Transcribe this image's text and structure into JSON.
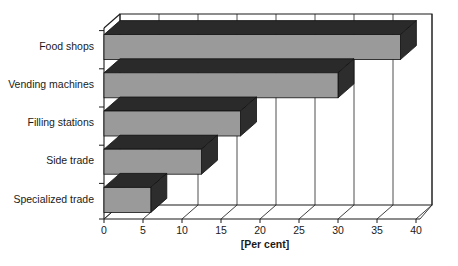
{
  "chart_data": {
    "type": "bar",
    "orientation": "horizontal",
    "style": "3d",
    "title": "",
    "subtitle": "",
    "xlabel": "[Per cent]",
    "ylabel": "",
    "categories": [
      "Specialized trade",
      "Side trade",
      "Filling stations",
      "Vending machines",
      "Food shops"
    ],
    "values": [
      6,
      12.5,
      17.5,
      30,
      38
    ],
    "xlim": [
      0,
      40
    ],
    "xticks": [
      0,
      5,
      10,
      15,
      20,
      25,
      30,
      35,
      40
    ],
    "xtick_labels": [
      "0",
      "5",
      "10",
      "15",
      "20",
      "25",
      "30",
      "35",
      "40"
    ],
    "grid": true,
    "grid_axis": "x",
    "legend": null,
    "legend_position": "none",
    "annotations": []
  },
  "colors": {
    "bar_front": "#9a9a9a",
    "bar_top": "#2a2a2a",
    "bar_side": "#2d2d2d",
    "axis": "#1a1a1a",
    "grid": "#3a3a3a",
    "background": "#ffffff",
    "text": "#1a1a1a"
  },
  "axis": {
    "x_title": "[Per cent]",
    "tick_labels": [
      "0",
      "5",
      "10",
      "15",
      "20",
      "25",
      "30",
      "35",
      "40"
    ]
  },
  "categories_top_to_bottom": [
    "Food shops",
    "Vending machines",
    "Filling stations",
    "Side trade",
    "Specialized trade"
  ],
  "bars_top_to_bottom": [
    {
      "label": "Food shops",
      "value": 38
    },
    {
      "label": "Vending machines",
      "value": 30
    },
    {
      "label": "Filling stations",
      "value": 17.5
    },
    {
      "label": "Side trade",
      "value": 12.5
    },
    {
      "label": "Specialized trade",
      "value": 6
    }
  ]
}
